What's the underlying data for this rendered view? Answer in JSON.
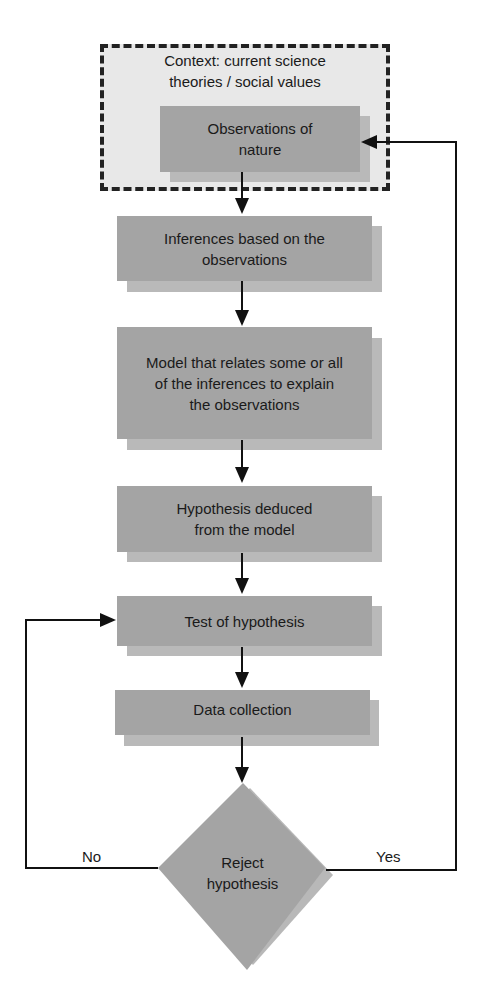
{
  "diagram": {
    "context": {
      "label": "Context: current science theories / social values"
    },
    "nodes": [
      {
        "id": "observations",
        "label": "Observations of nature"
      },
      {
        "id": "inferences",
        "label": "Inferences based on the observations"
      },
      {
        "id": "model",
        "label": "Model that relates some or all of the inferences to explain the observations"
      },
      {
        "id": "hypothesis",
        "label": "Hypothesis deduced from the model"
      },
      {
        "id": "test",
        "label": "Test of hypothesis"
      },
      {
        "id": "data",
        "label": "Data collection"
      },
      {
        "id": "decision",
        "label": "Reject hypothesis"
      }
    ],
    "branches": {
      "no": "No",
      "yes": "Yes"
    },
    "colors": {
      "box": "#a4a4a4",
      "shadow": "#b9b9b9",
      "context_fill": "#e8e8e8",
      "line": "#111111"
    }
  }
}
